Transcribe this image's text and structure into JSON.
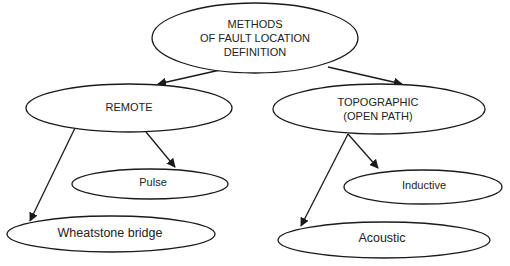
{
  "diagram": {
    "title": "Methods of fault location definition",
    "colors": {
      "stroke": "#1a1a1a",
      "text": "#222222",
      "background": "#ffffff"
    },
    "nodes": [
      {
        "id": "root",
        "lines": [
          "METHODS",
          "OF FAULT LOCATION",
          "DEFINITION"
        ],
        "cx": 255,
        "cy": 38,
        "rx": 103,
        "ry": 35
      },
      {
        "id": "remote",
        "lines": [
          "REMOTE"
        ],
        "cx": 129,
        "cy": 108,
        "rx": 103,
        "ry": 24
      },
      {
        "id": "topographic",
        "lines": [
          "TOPOGRAPHIC",
          "(OPEN PATH)"
        ],
        "cx": 379,
        "cy": 109,
        "rx": 106,
        "ry": 25
      },
      {
        "id": "pulse",
        "lines": [
          "Pulse"
        ],
        "cx": 150,
        "cy": 184,
        "rx": 78,
        "ry": 15
      },
      {
        "id": "wheatstone",
        "lines": [
          "Wheatstone bridge"
        ],
        "cx": 111,
        "cy": 234,
        "rx": 104,
        "ry": 18
      },
      {
        "id": "inductive",
        "lines": [
          "Inductive"
        ],
        "cx": 423,
        "cy": 187,
        "rx": 79,
        "ry": 17
      },
      {
        "id": "acoustic",
        "lines": [
          "Acoustic"
        ],
        "cx": 384,
        "cy": 240,
        "rx": 106,
        "ry": 18
      }
    ],
    "edges": [
      {
        "from": "root",
        "to": "remote"
      },
      {
        "from": "root",
        "to": "topographic"
      },
      {
        "from": "remote",
        "to": "pulse"
      },
      {
        "from": "remote",
        "to": "wheatstone"
      },
      {
        "from": "topographic",
        "to": "inductive"
      },
      {
        "from": "topographic",
        "to": "acoustic"
      }
    ],
    "labels": {
      "root_line1": "METHODS",
      "root_line2": "OF FAULT LOCATION",
      "root_line3": "DEFINITION",
      "remote": "REMOTE",
      "topographic_line1": "TOPOGRAPHIC",
      "topographic_line2": "(OPEN PATH)",
      "pulse": "Pulse",
      "wheatstone": "Wheatstone bridge",
      "inductive": "Inductive",
      "acoustic": "Acoustic"
    }
  }
}
